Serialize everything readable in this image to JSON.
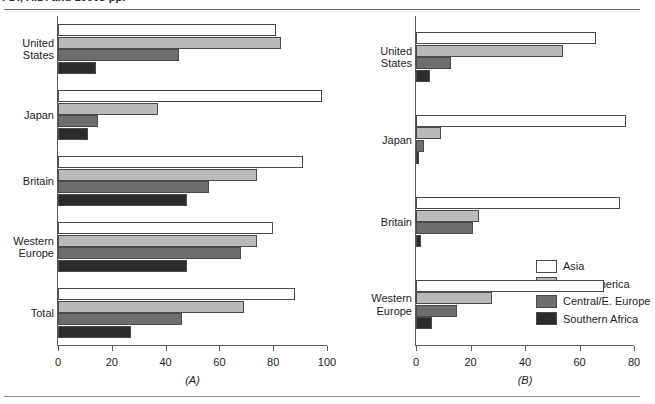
{
  "caption": {
    "text": "FDI, A.D. and 1990s pp."
  },
  "chart_data": [
    {
      "type": "bar",
      "orientation": "horizontal",
      "panel": "(A)",
      "title": "",
      "xlabel": "",
      "ylabel": "",
      "xlim": [
        0,
        100
      ],
      "xticks": [
        0,
        20,
        40,
        60,
        80,
        100
      ],
      "grid": false,
      "categories": [
        "United\nStates",
        "Japan",
        "Britain",
        "Western\nEurope",
        "Total"
      ],
      "series": [
        {
          "name": "Asia",
          "color": "#ffffff",
          "values": [
            81,
            98,
            91,
            80,
            88
          ]
        },
        {
          "name": "Latin America",
          "color": "#b9b9b9",
          "values": [
            83,
            37,
            74,
            74,
            69
          ]
        },
        {
          "name": "Central/E. Europe",
          "color": "#6e6e6e",
          "values": [
            45,
            15,
            56,
            68,
            46
          ]
        },
        {
          "name": "Southern Africa",
          "color": "#2b2b2b",
          "values": [
            14,
            11,
            48,
            48,
            27
          ]
        }
      ]
    },
    {
      "type": "bar",
      "orientation": "horizontal",
      "panel": "(B)",
      "title": "",
      "xlabel": "",
      "ylabel": "",
      "xlim": [
        0,
        80
      ],
      "xticks": [
        0,
        20,
        40,
        60,
        80
      ],
      "grid": false,
      "legend_position": "bottom-right",
      "categories": [
        "United\nStates",
        "Japan",
        "Britain",
        "Western\nEurope"
      ],
      "series": [
        {
          "name": "Asia",
          "color": "#ffffff",
          "values": [
            66,
            77,
            75,
            69
          ]
        },
        {
          "name": "Latin America",
          "color": "#b9b9b9",
          "values": [
            54,
            9,
            23,
            28
          ]
        },
        {
          "name": "Central/E. Europe",
          "color": "#6e6e6e",
          "values": [
            13,
            3,
            21,
            15
          ]
        },
        {
          "name": "Southern Africa",
          "color": "#2b2b2b",
          "values": [
            5,
            1,
            2,
            6
          ]
        }
      ]
    }
  ],
  "legend": {
    "items": [
      {
        "label": "Asia",
        "color": "#ffffff"
      },
      {
        "label": "Latin America",
        "color": "#b9b9b9"
      },
      {
        "label": "Central/E. Europe",
        "color": "#6e6e6e"
      },
      {
        "label": "Southern Africa",
        "color": "#2b2b2b"
      }
    ]
  }
}
